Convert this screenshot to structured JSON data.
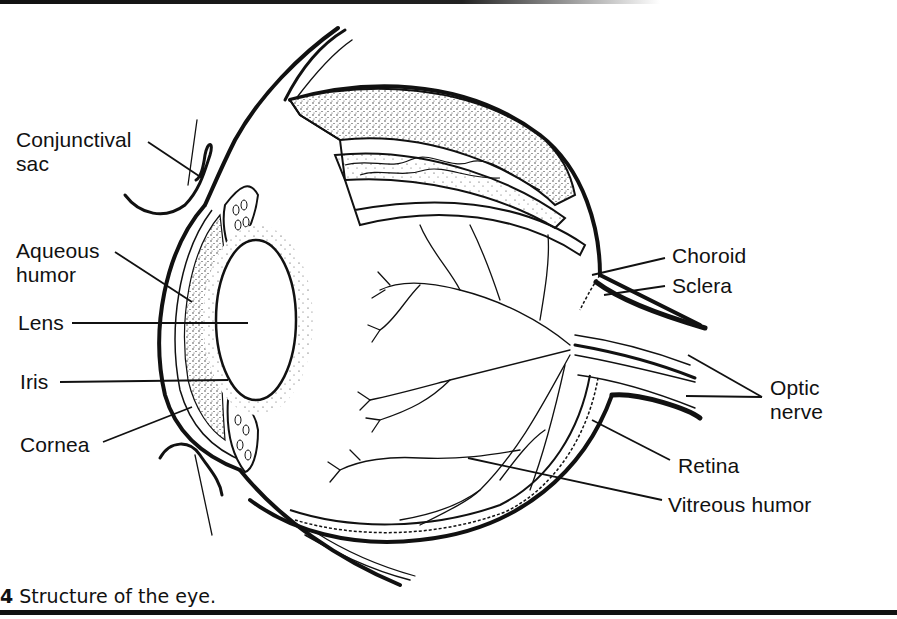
{
  "figure": {
    "caption_number": "4",
    "caption_text": "Structure of the eye."
  },
  "labels": {
    "conjunctival_sac": [
      "Conjunctival",
      "sac"
    ],
    "aqueous_humor": [
      "Aqueous",
      "humor"
    ],
    "lens": "Lens",
    "iris": "Iris",
    "cornea": "Cornea",
    "choroid": "Choroid",
    "sclera": "Sclera",
    "optic_nerve": [
      "Optic",
      "nerve"
    ],
    "retina": "Retina",
    "vitreous_humor": "Vitreous humor"
  },
  "colors": {
    "ink": "#111111",
    "paper": "#ffffff"
  }
}
